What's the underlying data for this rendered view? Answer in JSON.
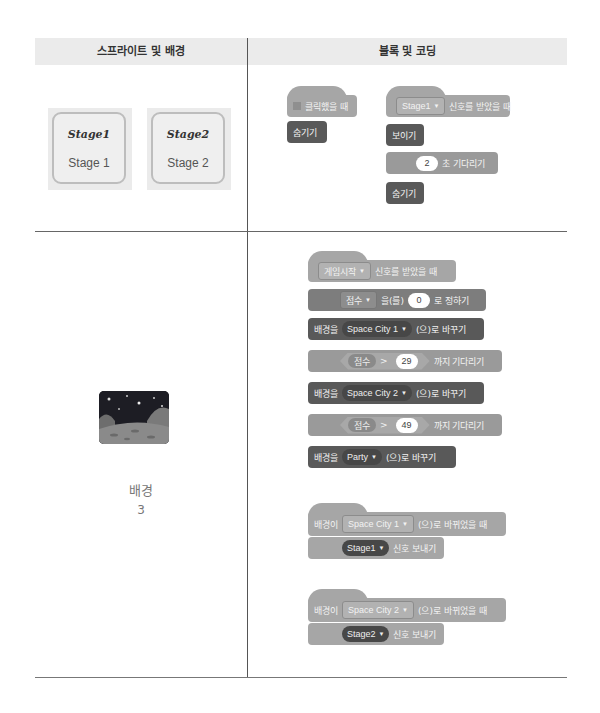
{
  "table": {
    "headers": [
      "스프라이트 및 배경",
      "블록 및 코딩"
    ]
  },
  "row1": {
    "sprites": [
      {
        "thumb_text": "Stage1",
        "name": "Stage 1"
      },
      {
        "thumb_text": "Stage2",
        "name": "Stage 2"
      }
    ],
    "scripts": {
      "flag_script": {
        "hat_label": "클릭했을 때",
        "blocks": [
          "숨기기"
        ]
      },
      "receive_script": {
        "hat_dropdown": "Stage1",
        "hat_label": "신호를 받았을 때",
        "show_label": "보이기",
        "wait_value": "2",
        "wait_label": "초 기다리기",
        "hide_label": "숨기기"
      }
    }
  },
  "row2": {
    "backdrop": {
      "name": "배경",
      "count": "3",
      "icon": "space-city-backdrop-thumbnail"
    },
    "scripts": {
      "game_start": {
        "hat_dropdown": "게임시작",
        "hat_label": "신호를 받았을 때",
        "set_var_dropdown": "점수",
        "set_var_mid": "을(를)",
        "set_var_value": "0",
        "set_var_end": "로 정하기",
        "switch1_prefix": "배경을",
        "switch1_dropdown": "Space City 1",
        "switch1_suffix": "(으)로 바꾸기",
        "wait1_var": "점수",
        "wait1_op": ">",
        "wait1_value": "29",
        "wait1_label": "까지 기다리기",
        "switch2_prefix": "배경을",
        "switch2_dropdown": "Space City 2",
        "switch2_suffix": "(으)로 바꾸기",
        "wait2_var": "점수",
        "wait2_op": ">",
        "wait2_value": "49",
        "wait2_label": "까지 기다리기",
        "switch3_prefix": "배경을",
        "switch3_dropdown": "Party",
        "switch3_suffix": "(으)로 바꾸기"
      },
      "backdrop_switch1": {
        "prefix": "배경이",
        "dropdown": "Space City 1",
        "suffix": "(으)로 바뀌었을 때",
        "broadcast_dropdown": "Stage1",
        "broadcast_label": "신호 보내기"
      },
      "backdrop_switch2": {
        "prefix": "배경이",
        "dropdown": "Space City 2",
        "suffix": "(으)로 바뀌었을 때",
        "broadcast_dropdown": "Stage2",
        "broadcast_label": "신호 보내기"
      }
    }
  },
  "icons": {
    "dropdown_arrow": "▼"
  },
  "colors": {
    "header_bg": "#ebebeb",
    "event_block": "#a6a6a6",
    "looks_block": "#595959",
    "control_block": "#9a9a9a"
  }
}
